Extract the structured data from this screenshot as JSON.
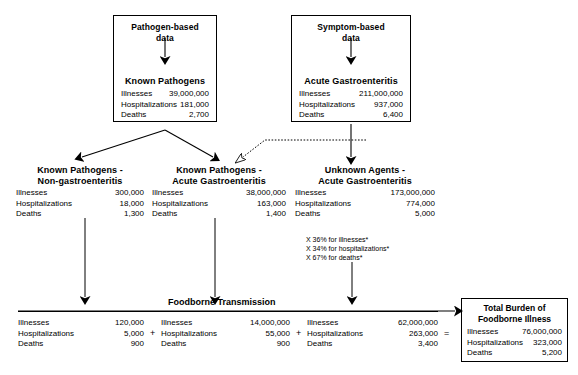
{
  "sources": [
    {
      "id": "pathogen-based",
      "source_label_line1": "Pathogen-based",
      "source_label_line2": "data",
      "group_title": "Known Pathogens",
      "stats": [
        {
          "label": "Illnesses",
          "value": "39,000,000"
        },
        {
          "label": "Hospitalizations",
          "value": "181,000"
        },
        {
          "label": "Deaths",
          "value": "2,700"
        }
      ]
    },
    {
      "id": "symptom-based",
      "source_label_line1": "Symptom-based",
      "source_label_line2": "data",
      "group_title": "Acute Gastroenteritis",
      "stats": [
        {
          "label": "Illnesses",
          "value": "211,000,000"
        },
        {
          "label": "Hospitalizations",
          "value": "937,000"
        },
        {
          "label": "Deaths",
          "value": "6,400"
        }
      ]
    }
  ],
  "middle": [
    {
      "id": "known-pathogens-non-gastro",
      "title_line1": "Known Pathogens -",
      "title_line2": "Non-gastroenteritis",
      "stats": [
        {
          "label": "Illnesses",
          "value": "300,000"
        },
        {
          "label": "Hospitalizations",
          "value": "18,000"
        },
        {
          "label": "Deaths",
          "value": "1,300"
        }
      ]
    },
    {
      "id": "known-pathogens-acute-gastro",
      "title_line1": "Known Pathogens -",
      "title_line2": "Acute Gastroenteritis",
      "stats": [
        {
          "label": "Illnesses",
          "value": "38,000,000"
        },
        {
          "label": "Hospitalizations",
          "value": "163,000"
        },
        {
          "label": "Deaths",
          "value": "1,400"
        }
      ]
    },
    {
      "id": "unknown-agents-acute-gastro",
      "title_line1": "Unknown Agents -",
      "title_line2": "Acute Gastroenteritis",
      "stats": [
        {
          "label": "Illnesses",
          "value": "173,000,000"
        },
        {
          "label": "Hospitalizations",
          "value": "774,000"
        },
        {
          "label": "Deaths",
          "value": "5,000"
        }
      ]
    }
  ],
  "percent_note": {
    "line1": "X 36% for illnesses*",
    "line2": "X 34% for hospitalizations*",
    "line3": "X 67% for deaths*"
  },
  "foodborne": {
    "title": "Foodborne Transmission",
    "columns": [
      {
        "id": "non-gastro",
        "stats": [
          {
            "label": "Illnesses",
            "value": "120,000"
          },
          {
            "label": "Hospitalizations",
            "value": "5,000"
          },
          {
            "label": "Deaths",
            "value": "900"
          }
        ]
      },
      {
        "id": "known-acute-gastro",
        "stats": [
          {
            "label": "Illnesses",
            "value": "14,000,000"
          },
          {
            "label": "Hospitalizations",
            "value": "55,000"
          },
          {
            "label": "Deaths",
            "value": "900"
          }
        ]
      },
      {
        "id": "unknown-acute-gastro",
        "stats": [
          {
            "label": "Illnesses",
            "value": "62,000,000"
          },
          {
            "label": "Hospitalizations",
            "value": "263,000"
          },
          {
            "label": "Deaths",
            "value": "3,400"
          }
        ]
      }
    ],
    "operators": {
      "plus1": "+",
      "plus2": "+",
      "equals": "="
    }
  },
  "total": {
    "title_line1": "Total Burden of",
    "title_line2": "Foodborne Illness",
    "stats": [
      {
        "label": "Illnesses",
        "value": "76,000,000"
      },
      {
        "label": "Hospitalizations",
        "value": "323,000"
      },
      {
        "label": "Deaths",
        "value": "5,200"
      }
    ]
  },
  "colors": {
    "ink": "#000000",
    "paper": "#ffffff"
  }
}
